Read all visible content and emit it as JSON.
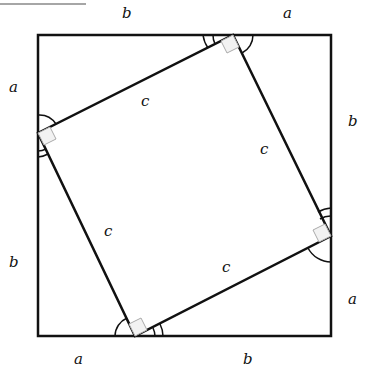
{
  "diagram": {
    "outer_square": {
      "x": 38,
      "y": 35,
      "width": 293,
      "height": 301
    },
    "inner_square_vertices": [
      [
        233,
        35
      ],
      [
        331,
        236
      ],
      [
        135,
        336
      ],
      [
        38,
        133
      ]
    ],
    "labels": {
      "top_b": "b",
      "top_a": "a",
      "right_b": "b",
      "right_a": "a",
      "bottom_a": "a",
      "bottom_b": "b",
      "left_a": "a",
      "left_b": "b",
      "c_top": "c",
      "c_right": "c",
      "c_bottom": "c",
      "c_left": "c"
    },
    "colors": {
      "stroke": "#111111",
      "right_angle_box": "#aaaaaa"
    }
  }
}
